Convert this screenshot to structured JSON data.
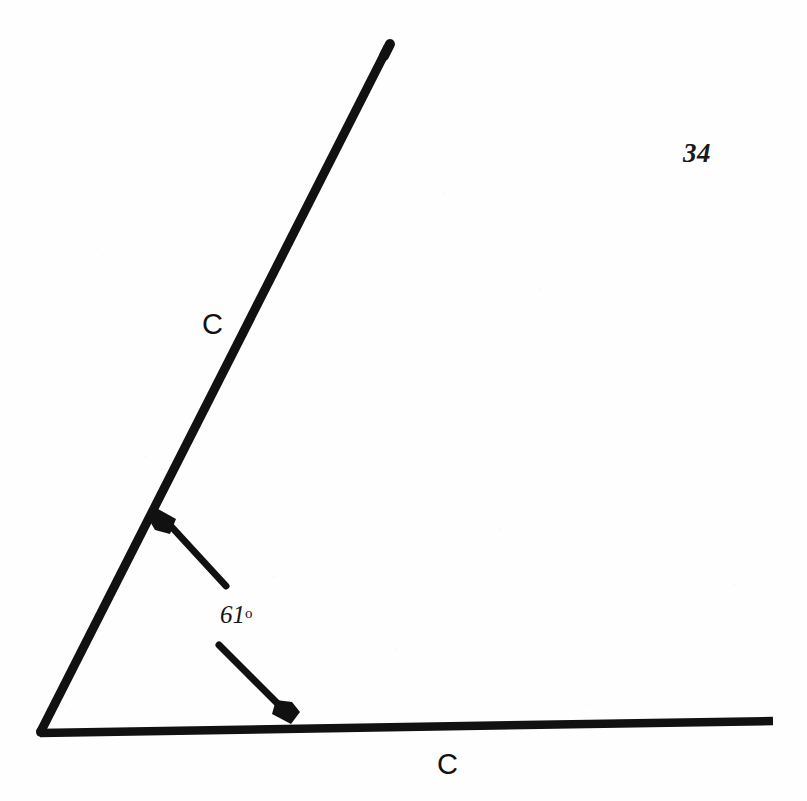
{
  "page": {
    "page_number": "34",
    "background_color": "#fefefe",
    "ink_color": "#111111"
  },
  "figure": {
    "name": "angle-diagram",
    "vertex": {
      "x": 40,
      "y": 733
    },
    "rays": [
      {
        "name": "diagonal-ray",
        "label": "C",
        "from": {
          "x": 40,
          "y": 733
        },
        "to": {
          "x": 388,
          "y": 47
        },
        "stroke_width": 9
      },
      {
        "name": "horizontal-ray",
        "label": "C",
        "from": {
          "x": 40,
          "y": 733
        },
        "to": {
          "x": 773,
          "y": 721
        },
        "stroke_width": 8
      }
    ],
    "arrows": [
      {
        "name": "arrow-to-diagonal-ray",
        "tail": {
          "x": 226,
          "y": 586
        },
        "tip": {
          "x": 158,
          "y": 512
        },
        "stroke_width": 7
      },
      {
        "name": "arrow-to-horizontal-ray",
        "tail": {
          "x": 219,
          "y": 645
        },
        "tip": {
          "x": 290,
          "y": 722
        },
        "stroke_width": 7
      }
    ],
    "angle": {
      "measure": "61",
      "degree_symbol": "o",
      "label_text": "61o"
    },
    "ray_label_upper": "C",
    "ray_label_lower": "C"
  }
}
